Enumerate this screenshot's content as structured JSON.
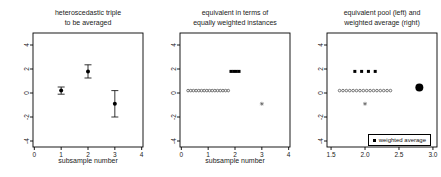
{
  "colors": {
    "marker": "#000000",
    "open_circle": "#555555",
    "text": "#1a1a1a",
    "axis": "#000000"
  },
  "chart_data": [
    {
      "type": "scatter",
      "title": [
        "heteroscedastic triple",
        "to be averaged"
      ],
      "xlabel": "subsample number",
      "xlim": [
        -0.05,
        4.05
      ],
      "ylim": [
        -4.5,
        5
      ],
      "grid": false,
      "xticks": {
        "values": [
          0,
          1,
          2,
          3,
          4
        ],
        "labels": [
          "0",
          "1",
          "2",
          "3",
          "4"
        ]
      },
      "yticks": {
        "values": [
          -4,
          -2,
          0,
          2,
          4
        ],
        "labels": [
          "-4",
          "-2",
          "0",
          "2",
          "4"
        ]
      },
      "series": [
        {
          "name": "subsample means with error bars",
          "marker": "errorbar-circle",
          "points": [
            {
              "x": 1,
              "y": 0.2,
              "err": 0.3
            },
            {
              "x": 2,
              "y": 1.8,
              "err": 0.55
            },
            {
              "x": 3,
              "y": -0.9,
              "err": 1.1
            }
          ]
        }
      ]
    },
    {
      "type": "scatter",
      "title": [
        "equivalent in terms of",
        "equally weighted instances"
      ],
      "xlabel": "subsample number",
      "xlim": [
        -0.05,
        4.05
      ],
      "ylim": [
        -4.5,
        5
      ],
      "grid": false,
      "xticks": {
        "values": [
          0,
          1,
          2,
          3,
          4
        ],
        "labels": [
          "0",
          "1",
          "2",
          "3",
          "4"
        ]
      },
      "yticks": {
        "values": [
          -4,
          -2,
          0,
          2,
          4
        ],
        "labels": [
          "-4",
          "-2",
          "0",
          "2",
          "4"
        ]
      },
      "series": [
        {
          "name": "subsample 1 as 16 equally weighted instances",
          "marker": "open-circle",
          "y": 0.2,
          "x": [
            0.25,
            0.35,
            0.45,
            0.55,
            0.65,
            0.75,
            0.85,
            0.95,
            1.05,
            1.15,
            1.25,
            1.35,
            1.45,
            1.55,
            1.65,
            1.75
          ]
        },
        {
          "name": "subsample 2 as 4 equally weighted instances",
          "marker": "filled-square",
          "y": 1.8,
          "x": [
            1.85,
            1.95,
            2.05,
            2.15
          ]
        },
        {
          "name": "subsample 3 as 1 instance",
          "marker": "asterisk",
          "points": [
            {
              "x": 3,
              "y": -0.9
            }
          ]
        }
      ]
    },
    {
      "type": "scatter",
      "title": [
        "equivalent pool (left) and",
        "weighted average (right)"
      ],
      "xlabel": "",
      "xlim": [
        1.44,
        3.06
      ],
      "ylim": [
        -4.5,
        5
      ],
      "grid": false,
      "xticks": {
        "values": [
          1.5,
          2.0,
          2.5,
          3.0
        ],
        "labels": [
          "1.5",
          "2.0",
          "2.5",
          "3.0"
        ]
      },
      "yticks": {
        "values": [
          -4,
          -2,
          0,
          2,
          4
        ],
        "labels": [
          "-4",
          "-2",
          "0",
          "2",
          "4"
        ]
      },
      "series": [
        {
          "name": "pooled 16 instances of subsample 1",
          "marker": "open-circle",
          "y": 0.2,
          "x": [
            1.625,
            1.675,
            1.725,
            1.775,
            1.825,
            1.875,
            1.925,
            1.975,
            2.025,
            2.075,
            2.125,
            2.175,
            2.225,
            2.275,
            2.325,
            2.375
          ]
        },
        {
          "name": "pooled 4 instances of subsample 2",
          "marker": "filled-square",
          "y": 1.8,
          "x": [
            1.85,
            1.95,
            2.05,
            2.15
          ]
        },
        {
          "name": "pooled 1 instance of subsample 3",
          "marker": "asterisk",
          "points": [
            {
              "x": 2.0,
              "y": -0.9
            }
          ]
        },
        {
          "name": "weighted average",
          "marker": "filled-circle",
          "size": 4,
          "points": [
            {
              "x": 2.8,
              "y": 0.45
            }
          ]
        }
      ],
      "legend": {
        "label": "weighted average",
        "marker": "filled-square",
        "position": "bottom-right"
      }
    }
  ]
}
